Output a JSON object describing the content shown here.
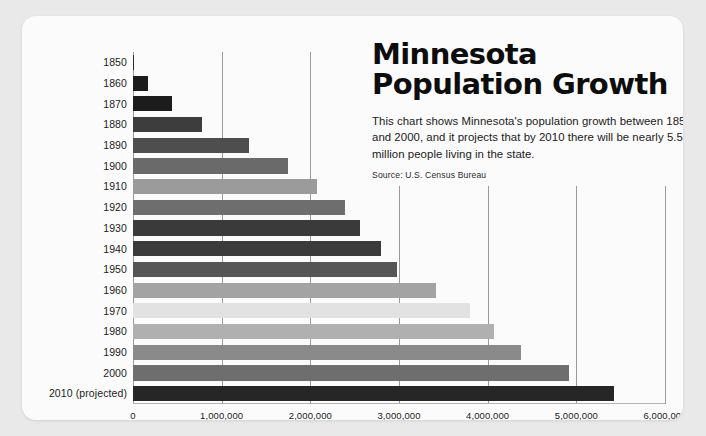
{
  "card": {
    "background": "#fbfbfb",
    "page_background": "#e9e9e9"
  },
  "title": "Minnesota\nPopulation Growth",
  "description": "This chart shows Minnesota's population growth between 1850 and 2000, and it projects that by 2010 there will be nearly 5.5 million people living in the state.",
  "source": "Source: U.S. Census Bureau",
  "chart_data": {
    "type": "bar",
    "orientation": "horizontal",
    "title": "Minnesota Population Growth",
    "subtitle": "This chart shows Minnesota's population growth between 1850 and 2000, and it projects that by 2010 there will be nearly 5.5 million people living in the state.",
    "source": "Source: U.S. Census Bureau",
    "xlabel": "",
    "ylabel": "",
    "xlim": [
      0,
      6000000
    ],
    "xticks": [
      0,
      1000000,
      2000000,
      3000000,
      4000000,
      5000000,
      6000000
    ],
    "xticklabels": [
      "0",
      "1,000,000",
      "2,000,000",
      "3,000,000",
      "4,000,000",
      "5,000,000",
      "6,000,000"
    ],
    "grid": true,
    "grid_axis": "x",
    "legend": false,
    "categories": [
      "1850",
      "1860",
      "1870",
      "1880",
      "1890",
      "1900",
      "1910",
      "1920",
      "1930",
      "1940",
      "1950",
      "1960",
      "1970",
      "1980",
      "1990",
      "2000",
      "2010 (projected)"
    ],
    "values": [
      6077,
      172023,
      439706,
      780773,
      1310283,
      1751394,
      2075708,
      2387125,
      2563953,
      2792300,
      2982483,
      3413864,
      3804971,
      4075970,
      4375099,
      4919479,
      5420636
    ],
    "bar_colors": [
      "#2a2a2a",
      "#1c1c1c",
      "#1c1c1c",
      "#3d3d3d",
      "#4e4e4e",
      "#6a6a6a",
      "#9b9b9b",
      "#6e6e6e",
      "#3a3a3a",
      "#3b3b3b",
      "#555555",
      "#a3a3a3",
      "#e2e2e2",
      "#b0b0b0",
      "#8a8a8a",
      "#6e6e6e",
      "#262626"
    ]
  }
}
